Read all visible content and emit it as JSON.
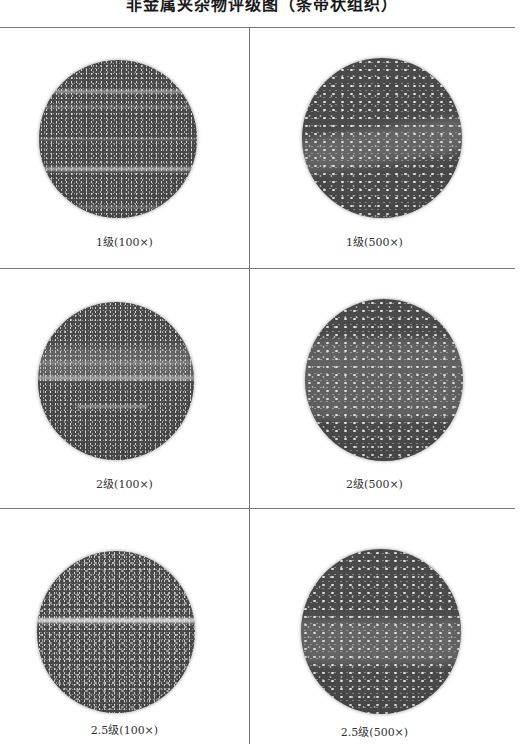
{
  "document": {
    "title": "非金属夹杂物评级图（条带状组织）"
  },
  "grid": {
    "columns": 2,
    "rows": 3,
    "line_color": "#777777"
  },
  "micrographs": [
    {
      "grade": "1级",
      "magnification": "100×",
      "caption": "1级(100×)",
      "style": "streaked-coarse"
    },
    {
      "grade": "1级",
      "magnification": "500×",
      "caption": "1级(500×)",
      "style": "speckled-fine"
    },
    {
      "grade": "2级",
      "magnification": "100×",
      "caption": "2级(100×)",
      "style": "banded-coarse"
    },
    {
      "grade": "2级",
      "magnification": "500×",
      "caption": "2级(500×)",
      "style": "diffuse-band-fine"
    },
    {
      "grade": "2.5级",
      "magnification": "100×",
      "caption": "2.5级(100×)",
      "style": "single-bright-line"
    },
    {
      "grade": "2.5级",
      "magnification": "500×",
      "caption": "2.5级(500×)",
      "style": "horizontal-cluster-fine"
    }
  ]
}
